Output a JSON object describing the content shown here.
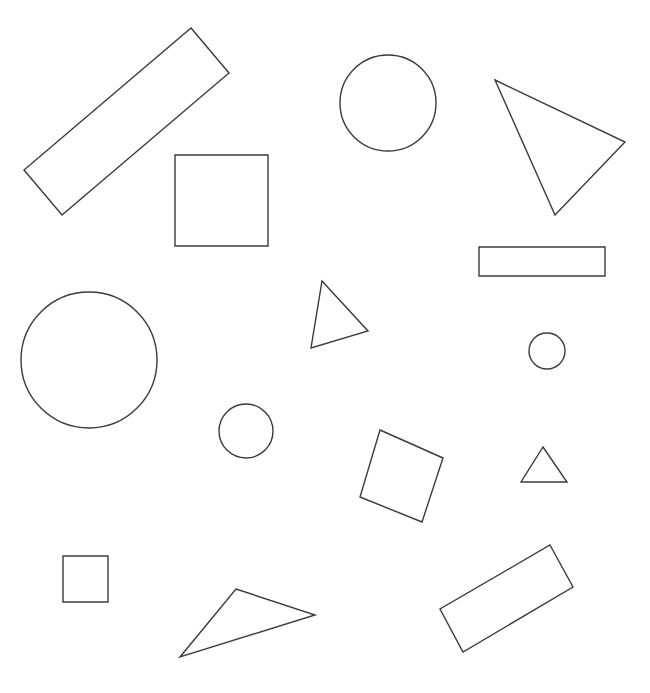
{
  "canvas": {
    "width": 650,
    "height": 693,
    "background_color": "#ffffff",
    "stroke_color": "#3a3a42",
    "stroke_width": 1.4,
    "fill": "none",
    "title": "",
    "shape_count": 14
  },
  "shapes": [
    {
      "id": "rotated-rectangle-large-top-left",
      "type": "rectangle",
      "label": "rectangle",
      "rotated": true,
      "points": "191,28 229,73 62,215 24,170",
      "center": [
        126.5,
        121.5
      ],
      "width": 59,
      "height": 218,
      "angle_deg": -40
    },
    {
      "id": "square-upper-left",
      "type": "square",
      "label": "square",
      "rotated": false,
      "x": 175,
      "y": 155,
      "width": 93,
      "height": 91,
      "points": "175,155 268,155 268,246 175,246",
      "center": [
        221.5,
        200.5
      ],
      "angle_deg": 0
    },
    {
      "id": "circle-top-center",
      "type": "circle",
      "label": "circle",
      "cx": 388,
      "cy": 103,
      "r": 48
    },
    {
      "id": "triangle-top-right",
      "type": "triangle",
      "label": "triangle",
      "points": "495,80 625,142 555,215",
      "center": [
        558.3,
        145.7
      ]
    },
    {
      "id": "rectangle-right-horizontal",
      "type": "rectangle",
      "label": "rectangle",
      "rotated": false,
      "x": 479,
      "y": 247,
      "width": 126,
      "height": 29,
      "points": "479,247 605,247 605,276 479,276",
      "center": [
        542,
        261.5
      ],
      "angle_deg": 0
    },
    {
      "id": "circle-large-left",
      "type": "circle",
      "label": "circle",
      "cx": 89,
      "cy": 360,
      "r": 68
    },
    {
      "id": "triangle-center",
      "type": "triangle",
      "label": "triangle",
      "points": "322,281 368,331 311,348",
      "center": [
        333.7,
        320
      ]
    },
    {
      "id": "circle-small-right",
      "type": "circle",
      "label": "circle",
      "cx": 547,
      "cy": 351,
      "r": 18
    },
    {
      "id": "circle-small-center",
      "type": "circle",
      "label": "circle",
      "cx": 246,
      "cy": 431,
      "r": 27
    },
    {
      "id": "rotated-square-center-bottom",
      "type": "square",
      "label": "square",
      "rotated": true,
      "points": "380,430 443,458 422,522 360,497",
      "center": [
        401.3,
        476.8
      ],
      "angle_deg": 24
    },
    {
      "id": "triangle-small-right",
      "type": "triangle",
      "label": "triangle",
      "points": "543,447 567,482 521,482",
      "center": [
        543.7,
        470.3
      ]
    },
    {
      "id": "square-small-bottom-left",
      "type": "square",
      "label": "square",
      "rotated": false,
      "x": 63,
      "y": 556,
      "width": 45,
      "height": 46,
      "points": "63,556 108,556 108,602 63,602",
      "center": [
        85.5,
        579
      ],
      "angle_deg": 0
    },
    {
      "id": "triangle-bottom-center",
      "type": "triangle",
      "label": "triangle",
      "points": "236,589 315,615 180,657",
      "center": [
        243.7,
        620.3
      ]
    },
    {
      "id": "rotated-rectangle-bottom-right",
      "type": "rectangle",
      "label": "rectangle",
      "rotated": true,
      "points": "550,545 573,587 463,652 440,609",
      "center": [
        506.5,
        598.3
      ],
      "angle_deg": 30
    }
  ]
}
